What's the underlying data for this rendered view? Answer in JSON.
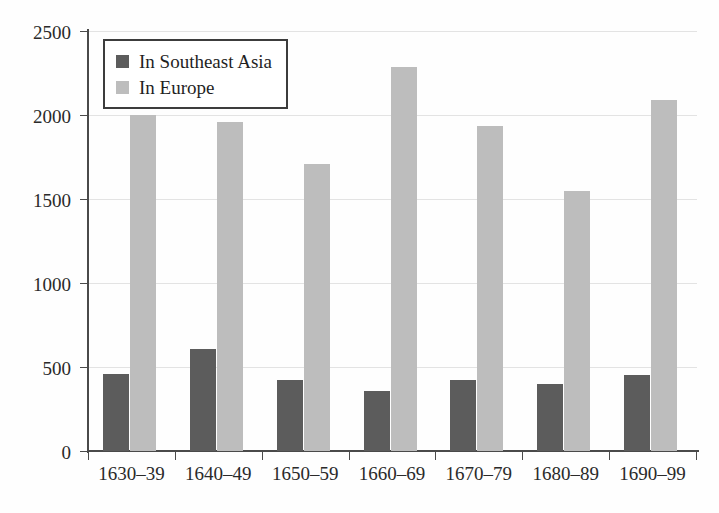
{
  "chart_data": {
    "type": "bar",
    "title": "",
    "subtitle": "",
    "xlabel": "",
    "ylabel": "",
    "categories": [
      "1630–39",
      "1640–49",
      "1650–59",
      "1660–69",
      "1670–79",
      "1680–89",
      "1690–99"
    ],
    "series": [
      {
        "name": "In Southeast Asia",
        "color": "#5c5c5c",
        "values": [
          460,
          605,
          420,
          360,
          425,
          400,
          450
        ]
      },
      {
        "name": "In Europe",
        "color": "#bdbdbd",
        "values": [
          2000,
          1960,
          1710,
          2285,
          1935,
          1550,
          2090
        ]
      }
    ],
    "ylim": [
      0,
      2500
    ],
    "yticks": [
      0,
      500,
      1000,
      1500,
      2000,
      2500
    ],
    "ytick_labels": [
      "0",
      "500",
      "1000",
      "1500",
      "2000",
      "2500"
    ],
    "grid": true,
    "grid_axis": "y",
    "legend_position": "top-left",
    "legend_border": true,
    "bar_group_gap": true
  },
  "legend": {
    "items": [
      {
        "label": "In Southeast Asia",
        "color": "#5c5c5c"
      },
      {
        "label": "In Europe",
        "color": "#bdbdbd"
      }
    ]
  },
  "axis": {
    "y_tick_labels": [
      "0",
      "500",
      "1000",
      "1500",
      "2000",
      "2500"
    ],
    "x_tick_labels": [
      "1630–39",
      "1640–49",
      "1650–59",
      "1660–69",
      "1670–79",
      "1680–89",
      "1690–99"
    ]
  },
  "colors": {
    "axis": "#4a4a4a",
    "grid": "#e3e3e3",
    "background": "#ffffff",
    "text": "#2a2a2a",
    "series_dark": "#5c5c5c",
    "series_light": "#bdbdbd"
  }
}
